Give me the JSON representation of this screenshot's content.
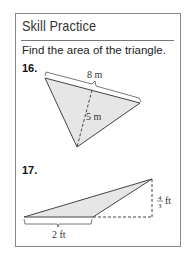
{
  "header": {
    "title": "Skill Practice"
  },
  "instruction": "Find the area of the triangle.",
  "problems": [
    {
      "number": "16.",
      "base_label": "8 m",
      "height_label": "5 m"
    },
    {
      "number": "17.",
      "base_label": "2 ft",
      "height_num": "4",
      "height_den": "3",
      "height_unit": "ft"
    }
  ],
  "colors": {
    "fill": "#e6e6e6",
    "stroke": "#444444",
    "border": "#888888"
  }
}
